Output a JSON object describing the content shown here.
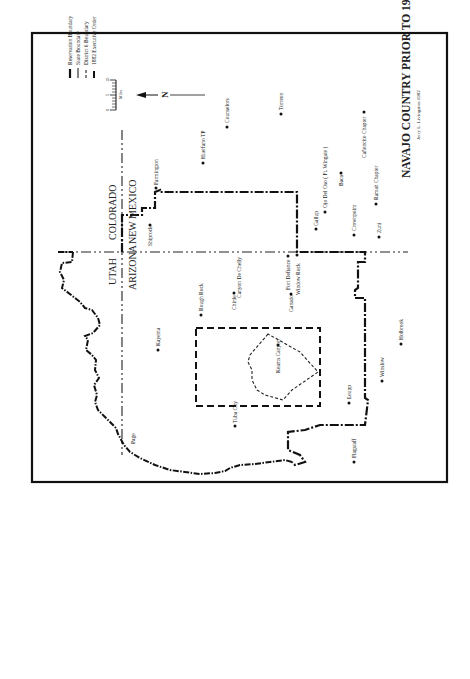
{
  "map": {
    "title": "NAVAJO COUNTRY PRIOR TO 1974",
    "credit": "Jerry L. Livingston 1982",
    "orientation": "rotated 90° counter-clockwise",
    "legend": {
      "items": [
        {
          "label": "Reservation Boundary",
          "style": "dash-dot-heavy"
        },
        {
          "label": "State Boundary",
          "style": "dash-dot-light"
        },
        {
          "label": "District 6 Boundary",
          "style": "short-dash"
        },
        {
          "label": "1882 Executive Order",
          "style": "long-dash"
        }
      ],
      "scale": {
        "ticks": [
          "0",
          "5",
          "10"
        ],
        "unit": "Miles"
      }
    },
    "north_arrow": {
      "label": "N"
    },
    "states": [
      {
        "label": "COLORADO"
      },
      {
        "label": "NEW MEXICO"
      },
      {
        "label": "UTAH"
      },
      {
        "label": "ARIZONA"
      }
    ],
    "places": [
      {
        "name": "Farmington"
      },
      {
        "name": "Huerfano TP"
      },
      {
        "name": "Counselors"
      },
      {
        "name": "Torreon"
      },
      {
        "name": "Shiprock"
      },
      {
        "name": "Gallup"
      },
      {
        "name": "Ojo Del Oso ( Ft. Wingate )"
      },
      {
        "name": "Baca"
      },
      {
        "name": "Cañoncito Chapter"
      },
      {
        "name": "Crownpoint"
      },
      {
        "name": "Ramah Chapter"
      },
      {
        "name": "Zuni"
      },
      {
        "name": "Canyon De Chelly"
      },
      {
        "name": "Fort Defiance"
      },
      {
        "name": "Window Rock"
      },
      {
        "name": "Rough Rock"
      },
      {
        "name": "Chinle"
      },
      {
        "name": "Ganado"
      },
      {
        "name": "Kayenta"
      },
      {
        "name": "Keams Canyon"
      },
      {
        "name": "Tuba City"
      },
      {
        "name": "Holbrook"
      },
      {
        "name": "Winslow"
      },
      {
        "name": "Leupp"
      },
      {
        "name": "Flagstaff"
      },
      {
        "name": "Page"
      }
    ]
  }
}
